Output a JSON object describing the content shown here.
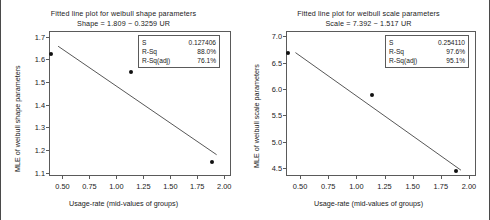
{
  "figure": {
    "background": "#ffffff",
    "frame_color": "#4a4a4a"
  },
  "charts": [
    {
      "id": "weibull-shape",
      "title_line1": "Fitted line plot for weibull shape parameters",
      "title_line2": "Shape =  1.809 − 0.3259 UR",
      "xlabel": "Usage-rate (mid-values of groups)",
      "ylabel": "MLE of weibull shape parameters",
      "stats": [
        {
          "key": "S",
          "value": "0.127406"
        },
        {
          "key": "R-Sq",
          "value": "88.0%"
        },
        {
          "key": "R-Sq(adj)",
          "value": "76.1%"
        }
      ],
      "xticks": [
        "0.50",
        "0.75",
        "1.00",
        "1.25",
        "1.50",
        "1.75",
        "2.00"
      ],
      "yticks": [
        "1.7",
        "1.6",
        "1.5",
        "1.4",
        "1.3",
        "1.2",
        "1.1"
      ]
    },
    {
      "id": "weibull-scale",
      "title_line1": "Fitted line plot for weibull scale parameters",
      "title_line2": "Scale =  7.392 − 1.517 UR",
      "xlabel": "Usage-rate (mid-values of groups)",
      "ylabel": "MLE of weibull scale parameters",
      "stats": [
        {
          "key": "S",
          "value": "0.254110"
        },
        {
          "key": "R-Sq",
          "value": "97.6%"
        },
        {
          "key": "R-Sq(adj)",
          "value": "95.1%"
        }
      ],
      "xticks": [
        "0.50",
        "0.75",
        "1.00",
        "1.25",
        "1.50",
        "1.75",
        "2.00"
      ],
      "yticks": [
        "7.0",
        "6.5",
        "6.0",
        "5.5",
        "5.0",
        "4.5"
      ]
    }
  ],
  "chart_data": [
    {
      "type": "scatter",
      "id": "weibull-shape",
      "title": "Fitted line plot for weibull shape parameters",
      "subtitle": "Shape =  1.809 − 0.3259 UR",
      "xlabel": "Usage-rate (mid-values of groups)",
      "ylabel": "MLE of weibull shape parameters",
      "xlim": [
        0.375,
        2.0625
      ],
      "ylim": [
        1.085,
        1.725
      ],
      "xticks": [
        0.5,
        0.75,
        1.0,
        1.25,
        1.5,
        1.75,
        2.0
      ],
      "yticks": [
        1.1,
        1.2,
        1.3,
        1.4,
        1.5,
        1.6,
        1.7
      ],
      "grid": false,
      "legend": false,
      "series": [
        {
          "name": "MLE of weibull shape parameters",
          "marker": "filled-circle",
          "color": "#111111",
          "x": [
            0.38,
            1.13,
            1.88
          ],
          "y": [
            1.63,
            1.55,
            1.15
          ]
        },
        {
          "name": "Fitted line",
          "type": "line",
          "color": "#444444",
          "intercept": 1.809,
          "slope": -0.3259,
          "x": [
            0.45,
            1.92
          ],
          "y": [
            1.6623,
            1.1833
          ]
        }
      ],
      "annotations": {
        "S": "0.127406",
        "R-Sq": "88.0%",
        "R-Sq(adj)": "76.1%"
      }
    },
    {
      "type": "scatter",
      "id": "weibull-scale",
      "title": "Fitted line plot for weibull scale parameters",
      "subtitle": "Scale =  7.392 − 1.517 UR",
      "xlabel": "Usage-rate (mid-values of groups)",
      "ylabel": "MLE of weibull scale parameters",
      "xlim": [
        0.375,
        2.0625
      ],
      "ylim": [
        4.35,
        7.1
      ],
      "xticks": [
        0.5,
        0.75,
        1.0,
        1.25,
        1.5,
        1.75,
        2.0
      ],
      "yticks": [
        4.5,
        5.0,
        5.5,
        6.0,
        6.5,
        7.0
      ],
      "grid": false,
      "legend": false,
      "series": [
        {
          "name": "MLE of weibull scale parameters",
          "marker": "filled-circle",
          "color": "#111111",
          "x": [
            0.38,
            1.13,
            1.88
          ],
          "y": [
            6.71,
            5.9,
            4.46
          ]
        },
        {
          "name": "Fitted line",
          "type": "line",
          "color": "#444444",
          "intercept": 7.392,
          "slope": -1.517,
          "x": [
            0.45,
            1.92
          ],
          "y": [
            6.7094,
            4.4793
          ]
        }
      ],
      "annotations": {
        "S": "0.254110",
        "R-Sq": "97.6%",
        "R-Sq(adj)": "95.1%"
      }
    }
  ]
}
